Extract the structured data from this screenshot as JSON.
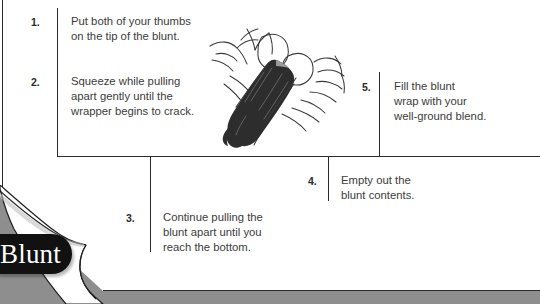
{
  "page": {
    "background_color": "#8e8e8e",
    "sheet_color": "#ffffff",
    "line_color": "#2b2b2b",
    "text_color": "#3c3c3c"
  },
  "tab": {
    "label": "Blunt",
    "background_color": "#111111",
    "text_color": "#ffffff"
  },
  "steps": [
    {
      "number": "1.",
      "text": "Put both of your thumbs\non the tip of the blunt."
    },
    {
      "number": "2.",
      "text": "Squeeze while pulling\napart gently until the\nwrapper begins to crack."
    },
    {
      "number": "3.",
      "text": "Continue pulling the\nblunt apart until you\nreach the bottom."
    },
    {
      "number": "4.",
      "text": "Empty out the\nblunt contents."
    },
    {
      "number": "5.",
      "text": "Fill the blunt\nwrap with your\nwell-ground blend."
    }
  ],
  "illustration": {
    "name": "hands-splitting-blunt-illustration",
    "description": "Two hands holding and splitting a dark blunt cigar"
  }
}
